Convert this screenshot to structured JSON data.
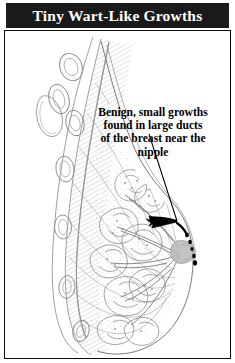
{
  "banner": {
    "title": "Tiny Wart-Like Growths",
    "background_color": "#1a1a1a",
    "text_color": "#ffffff"
  },
  "panel": {
    "border_color": "#0d0d0d",
    "background_color": "#ffffff"
  },
  "annotation": {
    "lines": [
      "Benign, small growths",
      "found in large ducts",
      "of the breast near the",
      "nipple"
    ],
    "text_color": "#000000",
    "alignment": "center"
  },
  "illustration": {
    "name": "breast-sagittal-cross-section",
    "description": "Grayscale anatomical line drawing of a breast in sagittal cross-section: chest wall and ribs at left, fatty and glandular lobular tissue filling the breast, milk ducts converging toward the nipple at right.",
    "line_color": "#8a8a8a",
    "accent_color": "#000000",
    "labels": []
  },
  "leader": {
    "name": "callout-leader-line",
    "color": "#000000",
    "start": {
      "x": 148,
      "y": 133
    },
    "end": {
      "x": 176,
      "y": 222
    },
    "arrow_tip": {
      "x": 148,
      "y": 218
    }
  },
  "markers": {
    "name": "duct-growth-droplets",
    "color": "#000000",
    "points": [
      {
        "x": 186,
        "y": 234
      },
      {
        "x": 189,
        "y": 241
      },
      {
        "x": 192,
        "y": 248
      },
      {
        "x": 194,
        "y": 255
      },
      {
        "x": 195,
        "y": 262
      }
    ]
  }
}
